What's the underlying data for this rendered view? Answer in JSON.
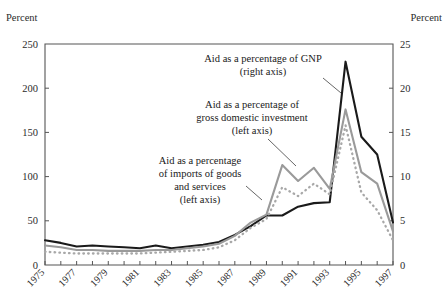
{
  "axis_titles": {
    "left": "Percent",
    "right": "Percent"
  },
  "annotations": {
    "gnp": {
      "line1": "Aid as a percentage of GNP",
      "line2": "(right axis)"
    },
    "gdi": {
      "line1": "Aid as a percentage of",
      "line2": "gross domestic investment",
      "line3": "(left axis)"
    },
    "imports": {
      "line1": "Aid as a percentage",
      "line2": "of imports of goods",
      "line3": "and services",
      "line4": "(left axis)"
    }
  },
  "chart_data": {
    "type": "line",
    "title": "",
    "xlabel": "",
    "ylabel": "Percent",
    "y2label": "Percent",
    "grid": false,
    "legend_position": "annotations-inline",
    "x": [
      1975,
      1976,
      1977,
      1978,
      1979,
      1980,
      1981,
      1982,
      1983,
      1984,
      1985,
      1986,
      1987,
      1988,
      1989,
      1990,
      1991,
      1992,
      1993,
      1994,
      1995,
      1996,
      1997
    ],
    "xticks": [
      "1975",
      "1977",
      "1979",
      "1981",
      "1983",
      "1985",
      "1987",
      "1989",
      "1991",
      "1993",
      "1995",
      "1997"
    ],
    "ylim": [
      0,
      250
    ],
    "yticks": [
      0,
      50,
      100,
      150,
      200,
      250
    ],
    "y2lim": [
      0,
      25
    ],
    "y2ticks": [
      0,
      5,
      10,
      15,
      20,
      25
    ],
    "series": [
      {
        "name": "Aid as a percentage of GNP",
        "axis": "right",
        "style": "solid-black",
        "color": "#1a1a1a",
        "values": [
          2.8,
          2.5,
          2.1,
          2.2,
          2.1,
          2.0,
          1.9,
          2.2,
          1.9,
          2.1,
          2.3,
          2.6,
          3.4,
          4.4,
          5.6,
          5.6,
          6.6,
          7.0,
          7.1,
          23.0,
          14.5,
          12.5,
          4.8
        ]
      },
      {
        "name": "Aid as a percentage of imports of goods and services",
        "axis": "left",
        "style": "solid-gray",
        "color": "#9a9a9a",
        "values": [
          22,
          20,
          17,
          17,
          16,
          16,
          16,
          17,
          17,
          19,
          21,
          24,
          33,
          48,
          57,
          113,
          95,
          110,
          86,
          176,
          105,
          92,
          38
        ]
      },
      {
        "name": "Aid as a percentage of gross domestic investment",
        "axis": "left",
        "style": "dotted-gray",
        "color": "#a8a8a8",
        "values": [
          15,
          14,
          13,
          13,
          13,
          13,
          13,
          14,
          15,
          16,
          17,
          20,
          28,
          42,
          52,
          88,
          78,
          92,
          80,
          158,
          82,
          62,
          28
        ]
      }
    ]
  }
}
